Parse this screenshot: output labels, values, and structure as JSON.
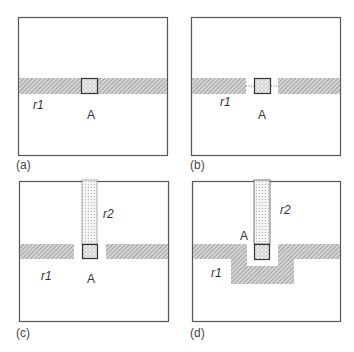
{
  "figure": {
    "panels": [
      {
        "id": "a",
        "caption": "(a)",
        "labels": {
          "r1": "r1",
          "A": "A"
        },
        "description": "Horizontal hatched region r1 fully spanning box with crosshatched cell A in middle"
      },
      {
        "id": "b",
        "caption": "(b)",
        "labels": {
          "r1": "r1",
          "A": "A"
        },
        "description": "Region r1 split around cell A, with dotted connection line through gap"
      },
      {
        "id": "c",
        "caption": "(c)",
        "labels": {
          "r1": "r1",
          "r2": "r2",
          "A": "A"
        },
        "description": "Vertical dotted region r2 enters from top to cell A, r1 split with gaps"
      },
      {
        "id": "d",
        "caption": "(d)",
        "labels": {
          "r1": "r1",
          "r2": "r2",
          "A": "A"
        },
        "description": "Region r1 detours below around cell A in a U shape; r2 reaches A from top"
      }
    ],
    "colors": {
      "border": "#555555",
      "hatch": "#9a9a9a",
      "hatch_bg": "#d8d8d8",
      "dots": "#b0b0b0",
      "cell_border": "#333333"
    }
  }
}
